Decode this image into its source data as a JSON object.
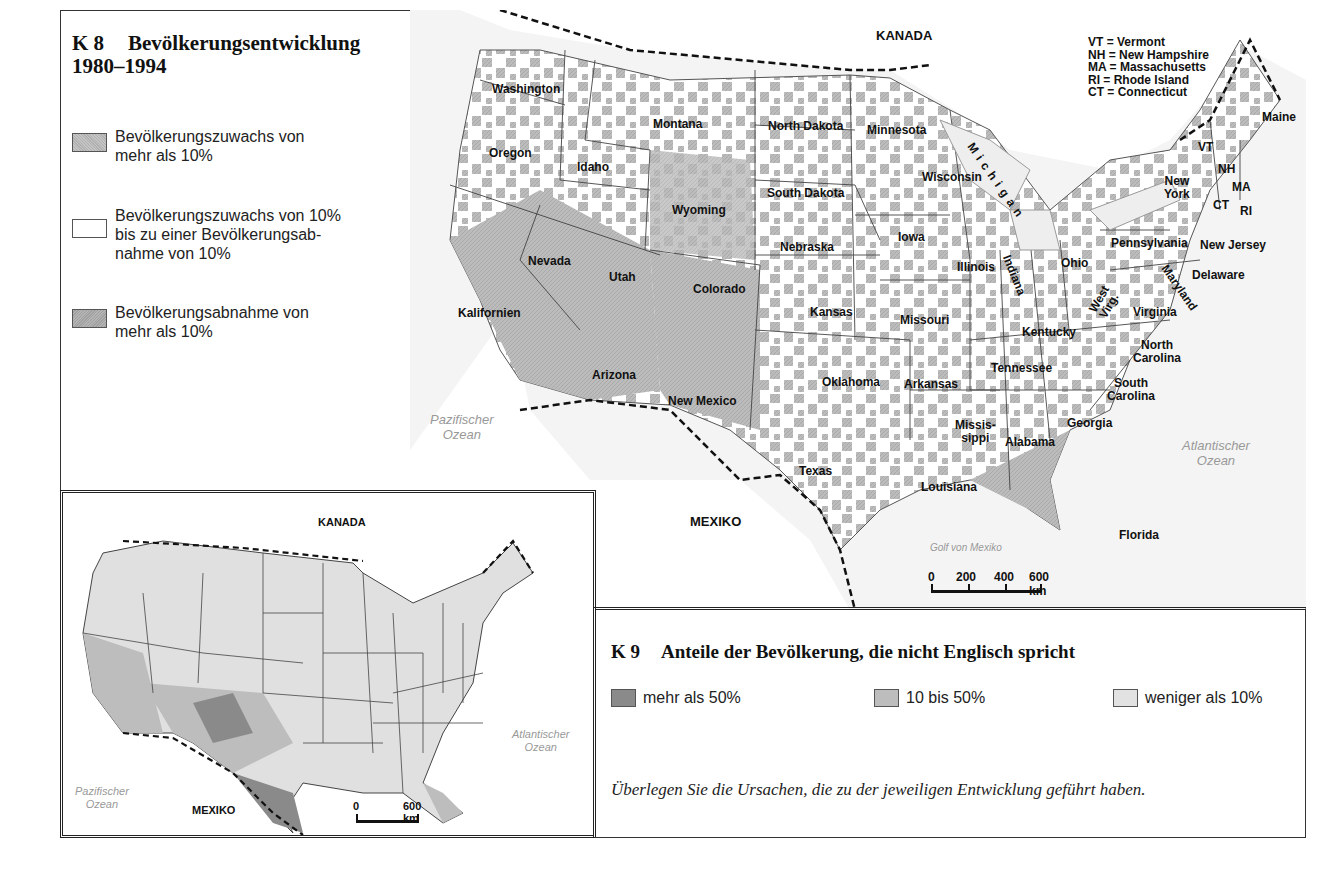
{
  "k8": {
    "number": "K 8",
    "title": "Bevölkerungsentwicklung",
    "period": "1980–1994",
    "legend": [
      {
        "label_line1": "Bevölkerungszuwachs von",
        "label_line2": "mehr als 10%",
        "color": "#b8b8b8"
      },
      {
        "label_line1": "Bevölkerungszuwachs von 10%",
        "label_line2": "bis zu einer Bevölkerungsab-",
        "label_line3": "nahme von 10%",
        "color": "#ffffff"
      },
      {
        "label_line1": "Bevölkerungsabnahme von",
        "label_line2": "mehr als 10%",
        "color": "#a8a8a8"
      }
    ],
    "abbreviations": [
      "VT  = Vermont",
      "NH = New Hampshire",
      "MA = Massachusetts",
      "RI  = Rhode Island",
      "CT  = Connecticut"
    ],
    "countries": {
      "north": "KANADA",
      "south": "MEXIKO"
    },
    "oceans": {
      "pacific_1": "Pazifischer",
      "pacific_2": "Ozean",
      "atlantic_1": "Atlantischer",
      "atlantic_2": "Ozean",
      "gulf": "Golf von Mexiko"
    },
    "scale": {
      "t0": "0",
      "t1": "200",
      "t2": "400",
      "t3": "600 km"
    },
    "states": {
      "washington": "Washington",
      "oregon": "Oregon",
      "idaho": "Idaho",
      "montana": "Montana",
      "north_dakota": "North Dakota",
      "minnesota": "Minnesota",
      "south_dakota": "South Dakota",
      "wyoming": "Wyoming",
      "wisconsin": "Wisconsin",
      "michigan": "Michigan",
      "nevada": "Nevada",
      "utah": "Utah",
      "colorado": "Colorado",
      "nebraska": "Nebraska",
      "iowa": "Iowa",
      "illinois": "Illinois",
      "indiana": "Indiana",
      "ohio": "Ohio",
      "pennsylvania": "Pennsylvania",
      "new_york_1": "New",
      "new_york_2": "York",
      "new_jersey": "New Jersey",
      "delaware": "Delaware",
      "maryland": "Maryland",
      "west_virginia_1": "West",
      "west_virginia_2": "Virg.",
      "virginia": "Virginia",
      "kalifornien": "Kalifornien",
      "kansas": "Kansas",
      "missouri": "Missouri",
      "kentucky": "Kentucky",
      "north_carolina_1": "North",
      "north_carolina_2": "Carolina",
      "tennessee": "Tennessee",
      "arizona": "Arizona",
      "new_mexico": "New Mexico",
      "oklahoma": "Oklahoma",
      "arkansas": "Arkansas",
      "south_carolina_1": "South",
      "south_carolina_2": "Carolina",
      "mississippi_1": "Missis-",
      "mississippi_2": "sippi",
      "alabama": "Alabama",
      "georgia": "Georgia",
      "texas": "Texas",
      "louisiana": "Louisiana",
      "florida": "Florida",
      "maine": "Maine",
      "vt": "VT",
      "nh": "NH",
      "ma": "MA",
      "ct": "CT",
      "ri": "RI"
    }
  },
  "k9": {
    "number": "K 9",
    "title": "Anteile der Bevölkerung, die nicht Englisch spricht",
    "legend": [
      {
        "label": "mehr als 50%",
        "color": "#8a8a8a"
      },
      {
        "label": "10 bis 50%",
        "color": "#bdbdbd"
      },
      {
        "label": "weniger als 10%",
        "color": "#e2e2e2"
      }
    ],
    "countries": {
      "north": "KANADA",
      "south": "MEXIKO"
    },
    "oceans": {
      "pacific_1": "Pazifischer",
      "pacific_2": "Ozean",
      "atlantic_1": "Atlantischer",
      "atlantic_2": "Ozean"
    },
    "scale": {
      "t0": "0",
      "t1": "600 km"
    }
  },
  "question": "Überlegen Sie die Ursachen, die zu der jeweiligen Entwicklung geführt haben."
}
